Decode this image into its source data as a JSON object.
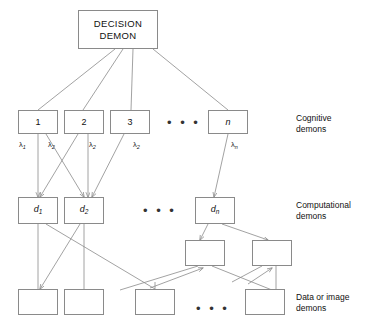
{
  "figure": {
    "background": "#ffffff",
    "line_color": "#8a8a8a",
    "text_color": "#111111"
  },
  "decision": {
    "label": "DECISION\nDEMON"
  },
  "cognitive": {
    "row_label": "Cognitive\ndemons",
    "ellipsis": "• • •",
    "nodes": [
      {
        "label": "1"
      },
      {
        "label": "2"
      },
      {
        "label": "3"
      },
      {
        "label": "n"
      }
    ],
    "weights": [
      {
        "base": "λ",
        "sub": "1"
      },
      {
        "base": "λ",
        "sub": "2"
      },
      {
        "base": "λ",
        "sub": "2"
      },
      {
        "base": "λ",
        "sub": "2"
      },
      {
        "base": "λ",
        "sub": "n"
      }
    ]
  },
  "computational": {
    "row_label": "Computational\ndemons",
    "ellipsis": "• • •",
    "nodes": [
      {
        "base": "d",
        "sub": "1"
      },
      {
        "base": "d",
        "sub": "2"
      },
      {
        "base": "d",
        "sub": "n"
      }
    ],
    "extra_nodes": [
      {
        "label": ""
      },
      {
        "label": ""
      }
    ]
  },
  "data_demons": {
    "row_label": "Data or image\ndemons",
    "ellipsis": "• • •",
    "nodes": [
      {
        "label": ""
      },
      {
        "label": ""
      },
      {
        "label": ""
      },
      {
        "label": ""
      }
    ]
  }
}
